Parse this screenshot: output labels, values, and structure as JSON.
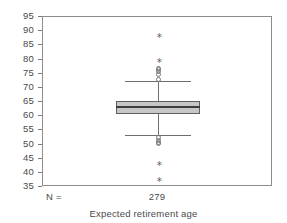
{
  "chart_data": {
    "type": "boxplot",
    "title": "",
    "subtitle": "",
    "xlabel": "Expected retirement age",
    "ylabel": "",
    "grid": false,
    "legend": null,
    "ylim": [
      35,
      95
    ],
    "ytick_labels": [
      "95",
      "90",
      "85",
      "80",
      "75",
      "70",
      "65",
      "60",
      "55",
      "50",
      "45",
      "40",
      "35"
    ],
    "ytick_values": [
      95,
      90,
      85,
      80,
      75,
      70,
      65,
      60,
      55,
      50,
      45,
      40,
      35
    ],
    "xtick_labels": [
      "279"
    ],
    "n_label": "N =",
    "n_values": [
      "279"
    ],
    "categories": [
      "Expected retirement age"
    ],
    "series": [
      {
        "name": "Expected retirement age",
        "n": 279,
        "whisker_low": 53.2,
        "q1": 60.6,
        "median": 63.2,
        "q3": 65.2,
        "whisker_high": 72.3,
        "outliers_mild": [
          76.9,
          76.3,
          75.6,
          74.8,
          73.1,
          52.3,
          51.4,
          50.8,
          50.2
        ],
        "outliers_extreme": [
          88.5,
          79.6,
          43.4,
          37.6
        ]
      }
    ],
    "colors": {
      "box_fill": "#c6c6c6",
      "box_border": "#5e5e5e",
      "median": "#3d3d3d",
      "whisker": "#6e6e6e",
      "frame": "#8c8c8c",
      "text": "#4a4a4a",
      "background": "#ffffff"
    }
  }
}
